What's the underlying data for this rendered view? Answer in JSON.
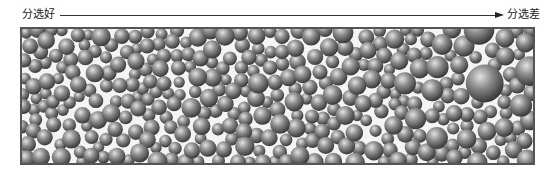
{
  "figure": {
    "label_left": "分选好",
    "label_right": "分选差",
    "arrow_direction": "left-to-right"
  },
  "grains": {
    "seed": 7,
    "count": 720,
    "base_radius": 7,
    "max_radius_left": 9,
    "max_radius_right": 26,
    "colors": {
      "highlight": "#d8d8d8",
      "mid": "#8a8a8a",
      "shadow": "#3a3a3a",
      "frame": "#555555",
      "background": "#f4f4f4"
    }
  }
}
